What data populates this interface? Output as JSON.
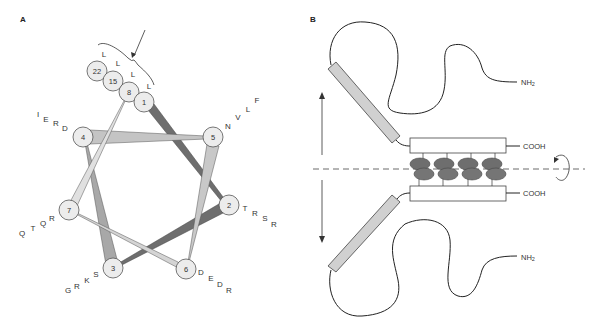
{
  "panels": {
    "a": {
      "label": "A"
    },
    "b": {
      "label": "B"
    }
  },
  "helical_wheel": {
    "colors": {
      "dark": "#6e6e6e",
      "medium": "#a8a8a8",
      "light": "#d4d4d4",
      "circle_fill": "#ececec"
    },
    "positions": [
      {
        "num": "1",
        "x": 146,
        "y": 102,
        "letters": [
          "L"
        ]
      },
      {
        "num": "2",
        "x": 229,
        "y": 205,
        "letters": [
          "T",
          "R",
          "S",
          "R"
        ]
      },
      {
        "num": "3",
        "x": 113,
        "y": 267,
        "letters": [
          "S",
          "K",
          "R",
          "G"
        ]
      },
      {
        "num": "4",
        "x": 83,
        "y": 136,
        "letters": [
          "D",
          "R",
          "E",
          "I"
        ]
      },
      {
        "num": "5",
        "x": 213,
        "y": 137,
        "letters": [
          "N",
          "V",
          "L",
          "F"
        ]
      },
      {
        "num": "6",
        "x": 186,
        "y": 268,
        "letters": [
          "D",
          "E",
          "D",
          "R"
        ]
      },
      {
        "num": "7",
        "x": 69,
        "y": 210,
        "letters": [
          "R",
          "Q",
          "T",
          "Q"
        ]
      },
      {
        "num": "8",
        "x": 128,
        "y": 92,
        "letters": [
          "L"
        ]
      },
      {
        "num": "15",
        "x": 112,
        "y": 80,
        "letters": [
          "L"
        ]
      },
      {
        "num": "22",
        "x": 97,
        "y": 71,
        "letters": [
          "L"
        ]
      }
    ],
    "annotation": "arrow-pointing-to-leucine-zipper-stripe"
  },
  "dimer_model": {
    "terminals": {
      "top_n": "NH",
      "top_n_sub": "2",
      "top_c": "COOH",
      "bottom_c": "COOH",
      "bottom_n": "NH",
      "bottom_n_sub": "2"
    },
    "leucine_pairs": 4,
    "icons": [
      "double-headed-vertical-arrow",
      "rotation-arrow",
      "dashed-axis-line"
    ]
  }
}
